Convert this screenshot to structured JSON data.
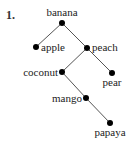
{
  "problem_number": "1.",
  "tree": {
    "nodes": [
      {
        "id": "banana",
        "label": "banana",
        "x": 62,
        "y": 23
      },
      {
        "id": "apple",
        "label": "apple",
        "x": 36,
        "y": 47
      },
      {
        "id": "peach",
        "label": "peach",
        "x": 87,
        "y": 48
      },
      {
        "id": "coconut",
        "label": "coconut",
        "x": 62,
        "y": 72
      },
      {
        "id": "pear",
        "label": "pear",
        "x": 112,
        "y": 73
      },
      {
        "id": "mango",
        "label": "mango",
        "x": 86,
        "y": 98
      },
      {
        "id": "papaya",
        "label": "papaya",
        "x": 110,
        "y": 123
      }
    ],
    "edges": [
      [
        "banana",
        "apple"
      ],
      [
        "banana",
        "peach"
      ],
      [
        "peach",
        "coconut"
      ],
      [
        "peach",
        "pear"
      ],
      [
        "coconut",
        "mango"
      ],
      [
        "mango",
        "papaya"
      ]
    ]
  },
  "labels": {
    "banana": "banana",
    "apple": "apple",
    "peach": "peach",
    "coconut": "coconut",
    "pear": "pear",
    "mango": "mango",
    "papaya": "papaya"
  }
}
